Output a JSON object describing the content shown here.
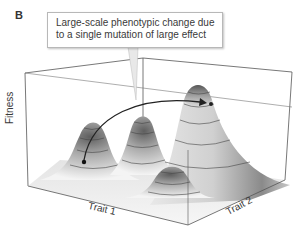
{
  "panel": {
    "label": "B"
  },
  "callout": {
    "line1": "Large-scale phenotypic change due",
    "line2": "to a single mutation of large effect"
  },
  "axes": {
    "z_label": "Fitness",
    "x_label": "Trait 1",
    "y_label": "Trait 2"
  },
  "peaks": [
    {
      "name": "left-peak",
      "relative_height": "medium"
    },
    {
      "name": "middle-peak",
      "relative_height": "medium"
    },
    {
      "name": "large-right-peak",
      "relative_height": "highest"
    },
    {
      "name": "front-peak",
      "relative_height": "low"
    }
  ],
  "arrow": {
    "from": "left-peak",
    "to": "large-right-peak"
  },
  "colors": {
    "frame": "#555555",
    "surface_light": "#f2f2f2",
    "surface_dark": "#6e6e6e",
    "contour": "#444444",
    "arrow": "#222222"
  }
}
